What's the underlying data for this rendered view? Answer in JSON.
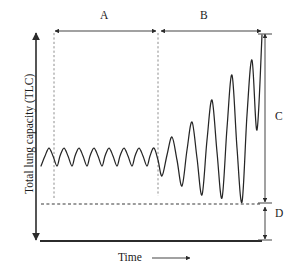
{
  "figure": {
    "title": "",
    "y_axis_label": "Total lung capacity (TLC)",
    "x_axis_label": "Time",
    "x_axis_arrow_icon": "right-arrow-icon",
    "annotations": {
      "region_a": "A",
      "region_b": "B",
      "bracket_c": "C",
      "bracket_d": "D"
    },
    "colors": {
      "trace": "#262626",
      "axis": "#2b2b2b",
      "guide_dashed_vertical": "#8e8e8e",
      "guide_dashed_horizontal": "#3a3a3a",
      "background": "#ffffff"
    }
  },
  "chart_data": {
    "type": "line",
    "title": "",
    "xlabel": "Time",
    "ylabel": "Total lung capacity (TLC)",
    "xlim": [
      0,
      297
    ],
    "ylim": [
      241,
      30
    ],
    "grid": false,
    "legend": null,
    "axis_ticks": {
      "x": [],
      "y": []
    },
    "regions": [
      {
        "name": "A",
        "label": "A",
        "x_start": 54,
        "x_end": 158,
        "pattern": "regular tidal breathing",
        "cycles": 8,
        "peak_y": 148,
        "trough_y": 166,
        "amplitude": 18
      },
      {
        "name": "B",
        "label": "B",
        "x_start": 158,
        "x_end": 262,
        "pattern": "crescendo / increasing amplitude",
        "cycles": 5,
        "peak_y_first": 137,
        "peak_y_last": 35,
        "trough_y_first": 176,
        "trough_y_last": 200,
        "amplitude_start": 39,
        "amplitude_end": 165
      }
    ],
    "brackets": [
      {
        "label": "C",
        "orientation": "vertical",
        "from_y": 33,
        "to_y": 203,
        "at_x": 265,
        "meaning": "capacity above residual level"
      },
      {
        "label": "D",
        "orientation": "vertical",
        "from_y": 205,
        "to_y": 240,
        "at_x": 265,
        "meaning": "residual level to baseline"
      },
      {
        "label": "A",
        "orientation": "horizontal",
        "from_x": 55,
        "to_x": 156,
        "at_y": 31
      },
      {
        "label": "B",
        "orientation": "horizontal",
        "from_x": 161,
        "to_x": 261,
        "at_y": 31
      }
    ],
    "reference_lines": [
      {
        "kind": "horizontal-dashed",
        "y": 204,
        "x_start": 41,
        "x_end": 261,
        "label": ""
      },
      {
        "kind": "vertical-dashed",
        "x": 54,
        "y_start": 33,
        "y_end": 200,
        "label": ""
      },
      {
        "kind": "vertical-dashed",
        "x": 158,
        "y_start": 33,
        "y_end": 196,
        "label": ""
      }
    ],
    "series": [
      {
        "name": "lung-volume",
        "points_x": [
          41,
          45,
          49,
          53,
          57,
          60,
          64,
          68,
          72,
          75,
          79,
          83,
          87,
          90,
          94,
          98,
          102,
          105,
          109,
          113,
          117,
          120,
          124,
          128,
          132,
          135,
          139,
          143,
          147,
          150,
          154,
          158,
          162,
          167,
          172,
          177,
          182,
          187,
          192,
          197,
          202,
          207,
          212,
          217,
          222,
          227,
          232,
          237,
          242,
          247,
          252,
          257,
          262
        ],
        "points_y": [
          166,
          156,
          148,
          156,
          166,
          156,
          148,
          156,
          166,
          156,
          148,
          156,
          166,
          156,
          148,
          156,
          166,
          156,
          148,
          156,
          166,
          156,
          148,
          156,
          166,
          156,
          148,
          156,
          166,
          156,
          148,
          160,
          176,
          155,
          137,
          160,
          186,
          150,
          122,
          158,
          195,
          140,
          100,
          152,
          198,
          128,
          75,
          148,
          202,
          115,
          60,
          130,
          35
        ]
      }
    ]
  }
}
